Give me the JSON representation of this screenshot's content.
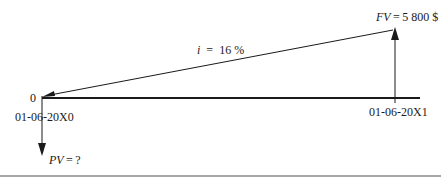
{
  "diagram": {
    "type": "cash-flow timeline",
    "period_label_start": "0",
    "start_date": "01-06-20X0",
    "end_date": "01-06-20X1",
    "interest": {
      "var": "i",
      "eq": "=",
      "value": "16 %"
    },
    "future_value": {
      "var": "FV",
      "eq": "=",
      "value": "5 800 $"
    },
    "present_value": {
      "var": "PV",
      "eq": "=",
      "value": "?"
    },
    "colors": {
      "line": "#1a1a1a",
      "rule": "#a8a8a8",
      "background": "#ffffff"
    }
  }
}
